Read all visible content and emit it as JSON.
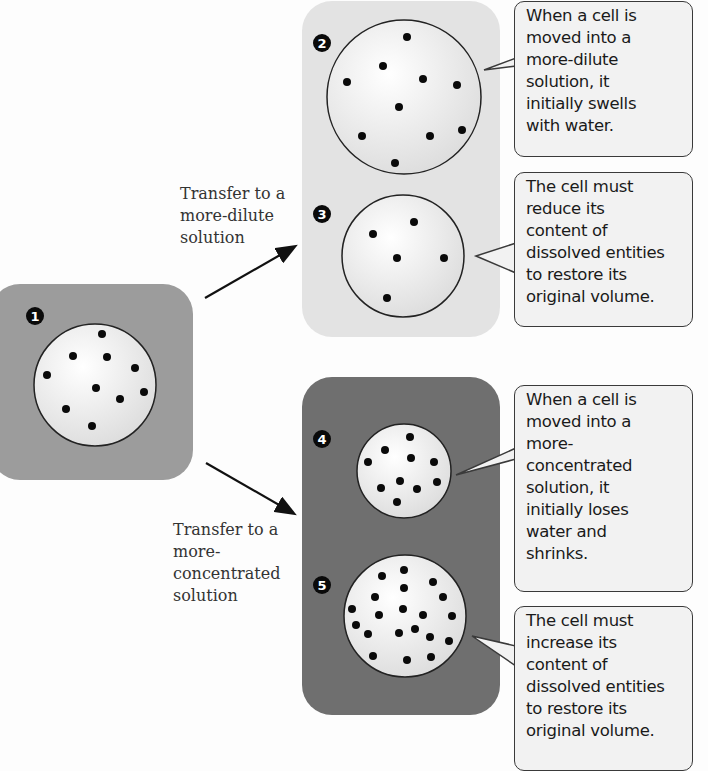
{
  "diagram": {
    "colors": {
      "dilute_panel": "#e3e3e3",
      "original_panel": "#9c9c9c",
      "concentrated_panel": "#6f6f6f",
      "cell_fill": "#f2f2f2",
      "cell_outline": "#222222",
      "solute_dot": "#0a0a0a"
    },
    "steps": [
      {
        "number": "1",
        "label": "Original cell",
        "solute_count": 10
      },
      {
        "number": "2",
        "label": "Swollen cell in more-dilute solution",
        "solute_count": 10
      },
      {
        "number": "3",
        "label": "Cell restored after reducing dissolved entities",
        "solute_count": 5
      },
      {
        "number": "4",
        "label": "Shrunken cell in more-concentrated solution",
        "solute_count": 10
      },
      {
        "number": "5",
        "label": "Cell restored after increasing dissolved entities",
        "solute_count": 20
      }
    ],
    "transfers": {
      "dilute": {
        "lines": [
          "Transfer to a",
          "more-dilute",
          "solution"
        ]
      },
      "concentrated": {
        "lines": [
          "Transfer to a",
          "more-",
          "concentrated",
          "solution"
        ]
      }
    },
    "callouts": [
      {
        "lines": [
          "When a cell is",
          "moved into a",
          "more-dilute",
          "solution, it",
          "initially swells",
          "with water."
        ]
      },
      {
        "lines": [
          "The cell must",
          "reduce its",
          "content of",
          "dissolved entities",
          "to restore its",
          "original volume."
        ]
      },
      {
        "lines": [
          "When a cell is",
          "moved into a",
          "more-",
          "concentrated",
          "solution, it",
          "initially loses",
          "water and",
          "shrinks."
        ]
      },
      {
        "lines": [
          "The cell must",
          "increase its",
          "content of",
          "dissolved entities",
          "to restore its",
          "original volume."
        ]
      }
    ]
  }
}
